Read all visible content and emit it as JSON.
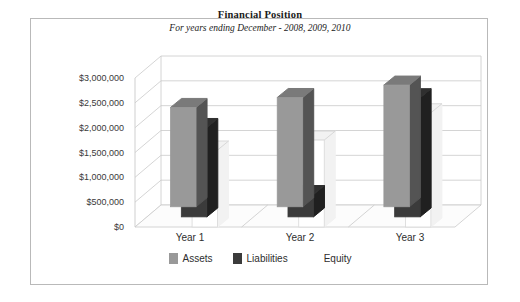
{
  "chart_data": {
    "type": "bar",
    "title": "Financial Position",
    "subtitle": "For years ending December - 2008, 2009, 2010",
    "xlabel": "",
    "ylabel": "",
    "categories": [
      "Year 1",
      "Year 2",
      "Year 3"
    ],
    "series": [
      {
        "name": "Assets",
        "color": "#999999",
        "values": [
          2000000,
          2200000,
          2450000
        ]
      },
      {
        "name": "Liabilities",
        "color": "#3b3b3b",
        "values": [
          1800000,
          450000,
          2400000
        ]
      },
      {
        "name": "Equity",
        "color": "#ffffff",
        "values": [
          1550000,
          1750000,
          2300000
        ]
      }
    ],
    "ylim": [
      0,
      3000000
    ],
    "ytick_labels": [
      "$3,000,000",
      "$2,500,000",
      "$2,000,000",
      "$1,500,000",
      "$1,000,000",
      "$500,000",
      "$0"
    ],
    "ytick_values": [
      3000000,
      2500000,
      2000000,
      1500000,
      1000000,
      500000,
      0
    ],
    "grid": true,
    "legend_position": "bottom",
    "three_d": true
  },
  "frame": {
    "border_color": "#b9b9b9",
    "background": "#ffffff"
  }
}
